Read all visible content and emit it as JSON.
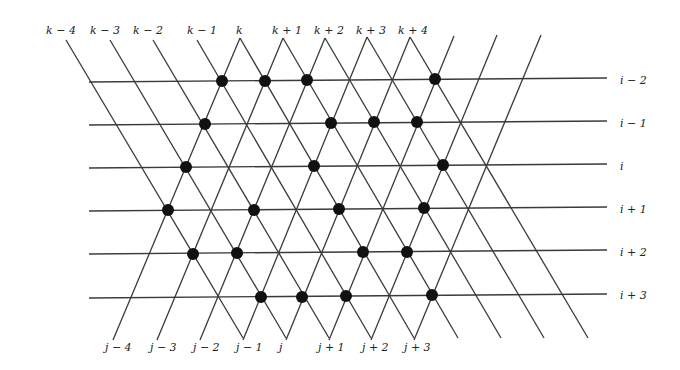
{
  "diagram": {
    "colors": {
      "line": "#3a3a3a",
      "dot": "#111111",
      "label": "#222222",
      "background": "#ffffff"
    },
    "top_labels": [
      "k − 4",
      "k − 3",
      "k − 2",
      "k − 1",
      "k",
      "k + 1",
      "k + 2",
      "k + 3",
      "k + 4"
    ],
    "bottom_labels": [
      "j − 4",
      "j − 3",
      "j − 2",
      "j − 1",
      "j",
      "j + 1",
      "j + 2",
      "j + 3"
    ],
    "right_labels": [
      "i − 2",
      "i − 1",
      "i",
      "i + 1",
      "i + 2",
      "i + 3"
    ],
    "top_label_positions": [
      [
        46,
        31
      ],
      [
        90,
        31
      ],
      [
        133,
        31
      ],
      [
        187,
        31
      ],
      [
        236,
        31
      ],
      [
        272,
        31
      ],
      [
        314,
        31
      ],
      [
        356,
        31
      ],
      [
        398,
        31
      ]
    ],
    "bottom_label_positions": [
      [
        105,
        348
      ],
      [
        150,
        348
      ],
      [
        193,
        348
      ],
      [
        236,
        348
      ],
      [
        279,
        348
      ],
      [
        318,
        348
      ],
      [
        362,
        348
      ],
      [
        404,
        348
      ]
    ],
    "right_label_positions": [
      [
        620,
        81
      ],
      [
        620,
        124
      ],
      [
        620,
        167
      ],
      [
        620,
        210
      ],
      [
        620,
        253
      ],
      [
        620,
        296
      ]
    ],
    "horizontal_lines": [
      {
        "x1": 89,
        "y1": 82,
        "x2": 607,
        "y2": 78
      },
      {
        "x1": 89,
        "y1": 125,
        "x2": 607,
        "y2": 121
      },
      {
        "x1": 89,
        "y1": 168,
        "x2": 607,
        "y2": 164
      },
      {
        "x1": 89,
        "y1": 211,
        "x2": 607,
        "y2": 207
      },
      {
        "x1": 89,
        "y1": 254,
        "x2": 607,
        "y2": 250
      },
      {
        "x1": 89,
        "y1": 298,
        "x2": 607,
        "y2": 294
      }
    ],
    "backslash_lines": [
      {
        "x1": 66,
        "y1": 40,
        "x2": 243,
        "y2": 338
      },
      {
        "x1": 110,
        "y1": 40,
        "x2": 286,
        "y2": 338
      },
      {
        "x1": 153,
        "y1": 40,
        "x2": 329,
        "y2": 338
      },
      {
        "x1": 197,
        "y1": 40,
        "x2": 371,
        "y2": 338
      },
      {
        "x1": 240,
        "y1": 38,
        "x2": 414,
        "y2": 338
      },
      {
        "x1": 283,
        "y1": 38,
        "x2": 458,
        "y2": 338
      },
      {
        "x1": 325,
        "y1": 38,
        "x2": 501,
        "y2": 338
      },
      {
        "x1": 367,
        "y1": 37,
        "x2": 544,
        "y2": 338
      },
      {
        "x1": 410,
        "y1": 37,
        "x2": 588,
        "y2": 338
      }
    ],
    "slash_lines": [
      {
        "x1": 113,
        "y1": 340,
        "x2": 240,
        "y2": 38
      },
      {
        "x1": 157,
        "y1": 340,
        "x2": 283,
        "y2": 38
      },
      {
        "x1": 200,
        "y1": 340,
        "x2": 325,
        "y2": 38
      },
      {
        "x1": 243,
        "y1": 340,
        "x2": 367,
        "y2": 37
      },
      {
        "x1": 286,
        "y1": 340,
        "x2": 410,
        "y2": 37
      },
      {
        "x1": 329,
        "y1": 340,
        "x2": 454,
        "y2": 36
      },
      {
        "x1": 371,
        "y1": 340,
        "x2": 497,
        "y2": 35
      },
      {
        "x1": 414,
        "y1": 340,
        "x2": 541,
        "y2": 35
      }
    ],
    "dots": [
      {
        "row": "i − 2",
        "x": 222,
        "y": 81
      },
      {
        "row": "i − 2",
        "x": 265,
        "y": 81
      },
      {
        "row": "i − 2",
        "x": 307,
        "y": 80
      },
      {
        "row": "i − 2",
        "x": 435,
        "y": 79
      },
      {
        "row": "i − 1",
        "x": 205,
        "y": 124
      },
      {
        "row": "i − 1",
        "x": 331,
        "y": 123
      },
      {
        "row": "i − 1",
        "x": 374,
        "y": 122
      },
      {
        "row": "i − 1",
        "x": 417,
        "y": 122
      },
      {
        "row": "i",
        "x": 186,
        "y": 167
      },
      {
        "row": "i",
        "x": 314,
        "y": 166
      },
      {
        "row": "i",
        "x": 443,
        "y": 165
      },
      {
        "row": "i + 1",
        "x": 168,
        "y": 210
      },
      {
        "row": "i + 1",
        "x": 254,
        "y": 210
      },
      {
        "row": "i + 1",
        "x": 339,
        "y": 209
      },
      {
        "row": "i + 1",
        "x": 424,
        "y": 208
      },
      {
        "row": "i + 2",
        "x": 193,
        "y": 254
      },
      {
        "row": "i + 2",
        "x": 237,
        "y": 253
      },
      {
        "row": "i + 2",
        "x": 363,
        "y": 252
      },
      {
        "row": "i + 2",
        "x": 407,
        "y": 252
      },
      {
        "row": "i + 3",
        "x": 261,
        "y": 297
      },
      {
        "row": "i + 3",
        "x": 302,
        "y": 297
      },
      {
        "row": "i + 3",
        "x": 346,
        "y": 296
      },
      {
        "row": "i + 3",
        "x": 432,
        "y": 295
      }
    ],
    "dot_radius": 6
  }
}
